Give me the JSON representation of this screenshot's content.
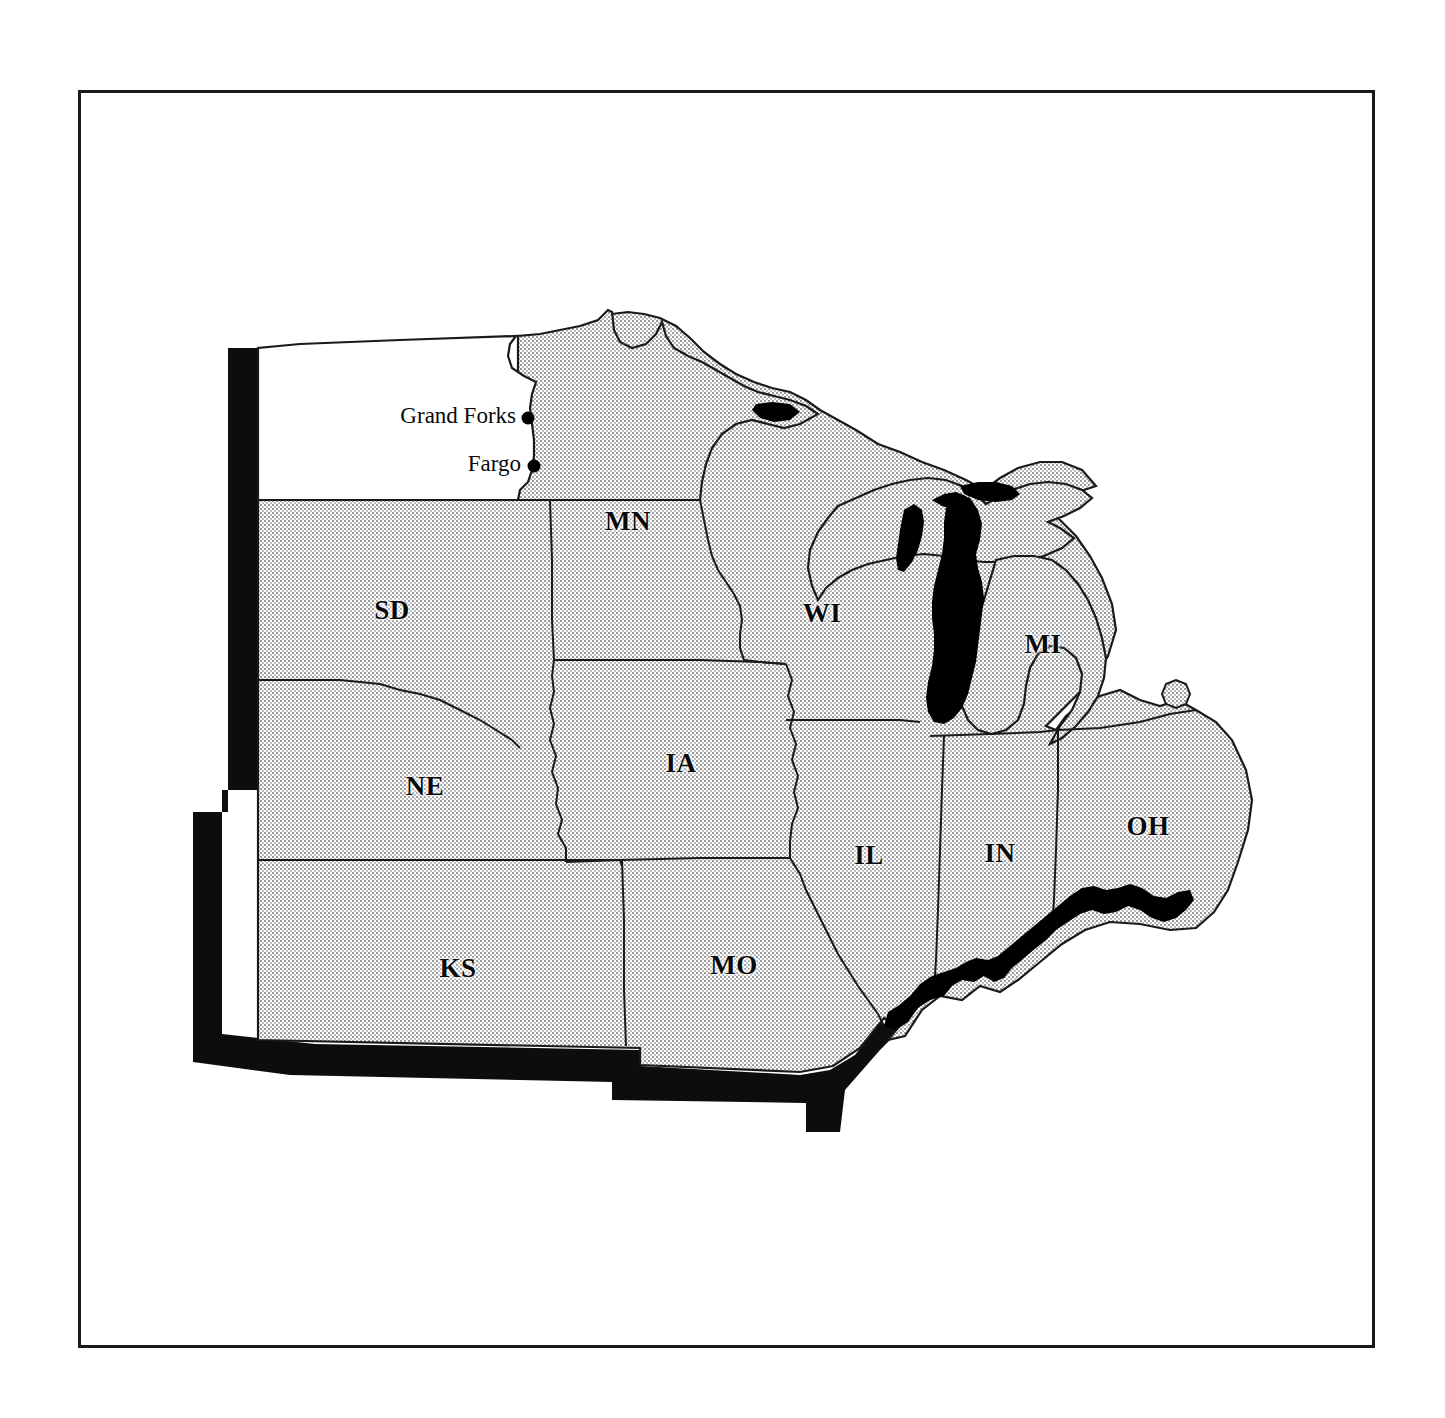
{
  "figure": {
    "kind": "reference-map",
    "frame": {
      "stroke": "#1a1a1a",
      "fill": "#ffffff"
    }
  },
  "map": {
    "title": "",
    "projection_note": "",
    "fills": {
      "shaded_state": "#d9d9d9",
      "highlight_state": "#ffffff",
      "water_black": "#000000",
      "outline": "#1a1a1a",
      "emphasis_border": "#0d0d0d"
    },
    "states": [
      {
        "code": "ND",
        "label": "",
        "shaded": false,
        "label_x": 0,
        "label_y": 0
      },
      {
        "code": "MN",
        "label": "MN",
        "shaded": true,
        "label_x": 628,
        "label_y": 521
      },
      {
        "code": "SD",
        "label": "SD",
        "shaded": true,
        "label_x": 392,
        "label_y": 610
      },
      {
        "code": "WI",
        "label": "WI",
        "shaded": true,
        "label_x": 822,
        "label_y": 613
      },
      {
        "code": "MI",
        "label": "MI",
        "shaded": true,
        "label_x": 1043,
        "label_y": 644
      },
      {
        "code": "IA",
        "label": "IA",
        "shaded": true,
        "label_x": 681,
        "label_y": 763
      },
      {
        "code": "NE",
        "label": "NE",
        "shaded": true,
        "label_x": 425,
        "label_y": 786
      },
      {
        "code": "OH",
        "label": "OH",
        "shaded": true,
        "label_x": 1148,
        "label_y": 826
      },
      {
        "code": "IL",
        "label": "IL",
        "shaded": true,
        "label_x": 869,
        "label_y": 855
      },
      {
        "code": "IN",
        "label": "IN",
        "shaded": true,
        "label_x": 1000,
        "label_y": 853
      },
      {
        "code": "MO",
        "label": "MO",
        "shaded": true,
        "label_x": 734,
        "label_y": 965
      },
      {
        "code": "KS",
        "label": "KS",
        "shaded": true,
        "label_x": 458,
        "label_y": 968
      }
    ],
    "cities": [
      {
        "name": "Grand Forks",
        "dot_x": 528,
        "dot_y": 418,
        "label_x": 516,
        "label_y": 416
      },
      {
        "name": "Fargo",
        "dot_x": 534,
        "dot_y": 466,
        "label_x": 521,
        "label_y": 464
      }
    ],
    "water_bodies": [
      {
        "name": "Lake Michigan",
        "fill": "#000000"
      },
      {
        "name": "Green Bay",
        "fill": "#000000"
      },
      {
        "name": "Lake Superior inlet",
        "fill": "#000000"
      },
      {
        "name": "Ohio River",
        "fill": "#000000"
      }
    ],
    "emphasis": {
      "description": "thick black band along western and southern outer boundary of region",
      "fill": "#0d0d0d"
    }
  }
}
